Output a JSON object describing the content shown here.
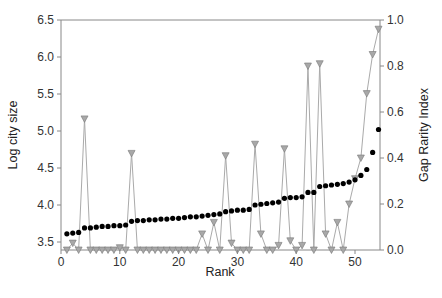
{
  "chart_data": {
    "type": "line",
    "title": "",
    "xlabel": "Rank",
    "ylabel": "Log city size",
    "y2label": "Gap Rarity Index",
    "xlim": [
      0,
      54
    ],
    "ylim": [
      3.4,
      6.5
    ],
    "y2lim": [
      0.0,
      1.0
    ],
    "xticks": [
      0,
      10,
      20,
      30,
      40,
      50
    ],
    "yticks": [
      3.5,
      4.0,
      4.5,
      5.0,
      5.5,
      6.0,
      6.5
    ],
    "y2ticks": [
      0.0,
      0.2,
      0.4,
      0.6,
      0.8,
      1.0
    ],
    "grid": false,
    "legend": null,
    "series": [
      {
        "name": "Log city size",
        "axis": "left",
        "marker": "circle",
        "color": "#000000",
        "x": [
          1,
          2,
          3,
          4,
          5,
          6,
          7,
          8,
          9,
          10,
          11,
          12,
          13,
          14,
          15,
          16,
          17,
          18,
          19,
          20,
          21,
          22,
          23,
          24,
          25,
          26,
          27,
          28,
          29,
          30,
          31,
          32,
          33,
          34,
          35,
          36,
          37,
          38,
          39,
          40,
          41,
          42,
          43,
          44,
          45,
          46,
          47,
          48,
          49,
          50,
          51,
          52,
          53,
          54
        ],
        "values": [
          3.61,
          3.62,
          3.63,
          3.69,
          3.69,
          3.7,
          3.71,
          3.71,
          3.72,
          3.72,
          3.73,
          3.78,
          3.79,
          3.79,
          3.8,
          3.8,
          3.81,
          3.81,
          3.82,
          3.82,
          3.83,
          3.84,
          3.84,
          3.85,
          3.86,
          3.87,
          3.88,
          3.91,
          3.92,
          3.93,
          3.93,
          3.94,
          4.0,
          4.01,
          4.02,
          4.03,
          4.04,
          4.09,
          4.1,
          4.1,
          4.11,
          4.17,
          4.17,
          4.25,
          4.26,
          4.27,
          4.28,
          4.29,
          4.31,
          4.34,
          4.4,
          4.48,
          4.71,
          5.02
        ]
      },
      {
        "name": "Gap Rarity Index",
        "axis": "right",
        "marker": "triangle-down",
        "color": "#999999",
        "x": [
          1,
          2,
          3,
          4,
          5,
          6,
          7,
          8,
          9,
          10,
          11,
          12,
          13,
          14,
          15,
          16,
          17,
          18,
          19,
          20,
          21,
          22,
          23,
          24,
          25,
          26,
          27,
          28,
          29,
          30,
          31,
          32,
          33,
          34,
          35,
          36,
          37,
          38,
          39,
          40,
          41,
          42,
          43,
          44,
          45,
          46,
          47,
          48,
          49,
          50,
          51,
          52,
          53,
          54
        ],
        "values": [
          0.0,
          0.03,
          0.0,
          0.57,
          0.0,
          0.0,
          0.0,
          0.0,
          0.0,
          0.01,
          0.0,
          0.42,
          0.0,
          0.0,
          0.0,
          0.0,
          0.0,
          0.0,
          0.0,
          0.0,
          0.0,
          0.0,
          0.0,
          0.07,
          0.0,
          0.12,
          0.0,
          0.41,
          0.03,
          0.0,
          0.0,
          0.0,
          0.46,
          0.07,
          0.0,
          0.0,
          0.02,
          0.44,
          0.04,
          0.0,
          0.02,
          0.8,
          0.0,
          0.81,
          0.07,
          0.0,
          0.12,
          0.0,
          0.2,
          0.31,
          0.4,
          0.68,
          0.85,
          0.96
        ]
      }
    ]
  }
}
